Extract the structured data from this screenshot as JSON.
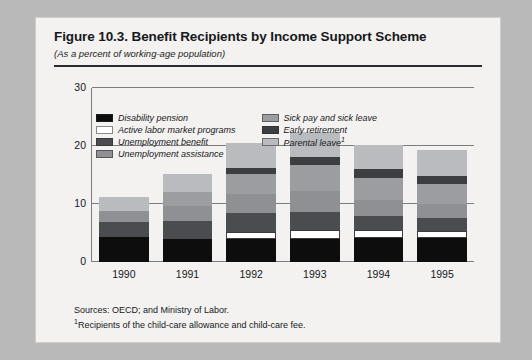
{
  "figure": {
    "title": "Figure 10.3. Benefit Recipients by Income Support Scheme",
    "subtitle": "(As a percent of working-age population)",
    "sources": "Sources:  OECD; and Ministry of Labor.",
    "footnote_marker": "1",
    "footnote": "Recipients of the child-care allowance and child-care fee."
  },
  "colors": {
    "disability_pension": "#0d0d0d",
    "active_labor_market_programs": "#ffffff",
    "unemployment_benefit": "#4a4c50",
    "unemployment_assistance": "#8e9094",
    "sick_pay_and_sick_leave": "#9b9da1",
    "early_retirement": "#3c3e42",
    "parental_leave": "#b9bbbf",
    "page_background": "#f3f2f0",
    "axis": "#7a7c80",
    "text": "#16181c"
  },
  "chart_data": {
    "type": "bar",
    "title": "Figure 10.3. Benefit Recipients by Income Support Scheme",
    "subtitle": "(As a percent of working-age population)",
    "stacked": true,
    "xlabel": "",
    "ylabel": "",
    "ylim": [
      0,
      30
    ],
    "yticks": [
      0,
      10,
      20,
      30
    ],
    "grid": true,
    "legend_position": "inside-top-left",
    "categories": [
      "1990",
      "1991",
      "1992",
      "1993",
      "1994",
      "1995"
    ],
    "series": [
      {
        "name": "Disability pension",
        "color_key": "disability_pension",
        "values": [
          4.3,
          4.0,
          4.0,
          4.0,
          4.1,
          4.2
        ]
      },
      {
        "name": "Active labor market programs",
        "color_key": "active_labor_market_programs",
        "values": [
          0.0,
          0.0,
          1.2,
          1.5,
          1.4,
          1.2
        ]
      },
      {
        "name": "Unemployment benefit",
        "color_key": "unemployment_benefit",
        "values": [
          2.6,
          3.0,
          3.3,
          3.2,
          2.4,
          2.2
        ]
      },
      {
        "name": "Unemployment assistance",
        "color_key": "unemployment_assistance",
        "values": [
          1.9,
          2.6,
          3.2,
          3.6,
          2.8,
          2.4
        ]
      },
      {
        "name": "Sick pay and sick leave",
        "color_key": "sick_pay_and_sick_leave",
        "values": [
          0.0,
          2.4,
          3.4,
          4.4,
          3.8,
          3.4
        ]
      },
      {
        "name": "Early retirement",
        "color_key": "early_retirement",
        "values": [
          0.0,
          0.0,
          1.2,
          1.5,
          1.5,
          1.4
        ]
      },
      {
        "name": "Parental leave",
        "color_key": "parental_leave",
        "values": [
          2.5,
          3.2,
          4.2,
          4.3,
          4.2,
          4.6
        ]
      }
    ],
    "totals": [
      11.3,
      15.2,
      20.5,
      22.5,
      20.2,
      19.4
    ]
  },
  "legend": {
    "left": [
      {
        "label": "Disability pension",
        "color_key": "disability_pension"
      },
      {
        "label": "Active labor market programs",
        "color_key": "active_labor_market_programs"
      },
      {
        "label": "Unemployment benefit",
        "color_key": "unemployment_benefit"
      },
      {
        "label": "Unemployment assistance",
        "color_key": "unemployment_assistance"
      }
    ],
    "right": [
      {
        "label": "Sick pay and sick leave",
        "color_key": "sick_pay_and_sick_leave"
      },
      {
        "label": "Early retirement",
        "color_key": "early_retirement"
      },
      {
        "label": "Parental leave",
        "color_key": "parental_leave",
        "sup": "1"
      }
    ]
  }
}
